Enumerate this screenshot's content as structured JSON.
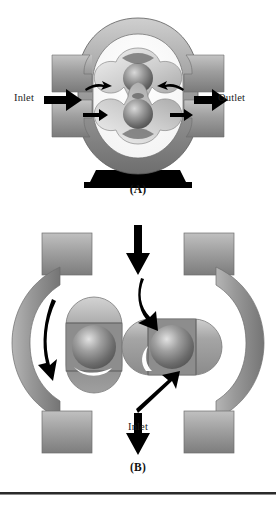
{
  "figure": {
    "type": "technical-illustration",
    "background_color": "#ffffff",
    "panels": [
      {
        "id": "A",
        "caption": "(A)",
        "view": "cross-section front view",
        "labels": {
          "inlet": "Inlet",
          "outlet": "Outlet"
        },
        "flow_direction": "left to right",
        "rotor_count": 2,
        "lobes_per_rotor": 3
      },
      {
        "id": "B",
        "caption": "(B)",
        "view": "cross-section side view",
        "labels": {
          "inlet": "Inlet",
          "outlet": "Outlet"
        },
        "flow_direction": "top to bottom",
        "rotor_count": 2,
        "lobes_per_rotor": 3
      }
    ]
  },
  "colors": {
    "housing_light": "#c9c9c9",
    "housing_mid": "#9a9a9a",
    "housing_dark": "#6f6f6f",
    "rotor_light": "#d8d8d8",
    "rotor_mid": "#a8a8a8",
    "hub_light": "#e6e6e6",
    "hub_dark": "#4f4f4f",
    "arrow_black": "#000000",
    "arrow_white": "#ffffff",
    "base_black": "#000000",
    "rule": "#2a2a2a",
    "text": "#1a1a1a"
  },
  "panel_a": {
    "caption": "(A)",
    "inlet_label": "Inlet",
    "outlet_label": "Outlet",
    "inlet_arrow": "thick-right-arrow",
    "outlet_arrow": "thick-right-arrow",
    "flow_arrows": [
      "curved-flow-arrow",
      "curved-flow-arrow",
      "curved-flow-arrow",
      "curved-flow-arrow"
    ],
    "base": "pedestal-base"
  },
  "panel_b": {
    "caption": "(B)",
    "inlet_label": "Inlet",
    "outlet_label": "Outlet",
    "inlet_arrow": "down-arrow",
    "outlet_arrow": "down-arrow",
    "rotation_arrows": [
      "curved-rotation-arrow-left",
      "curved-rotation-arrow-right"
    ],
    "flow_arrows": [
      "curved-flow-arrow-inlet",
      "flow-arrow-outlet"
    ]
  }
}
